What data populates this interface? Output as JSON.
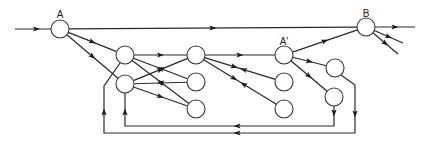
{
  "diagram": {
    "type": "directed-network",
    "colors": {
      "line": "#2a2a2a",
      "node_fill": "#ffffff",
      "node_stroke": "#3a3a3a"
    },
    "nodes": [
      {
        "id": "A",
        "label": "A"
      },
      {
        "id": "L1",
        "label": ""
      },
      {
        "id": "L2",
        "label": ""
      },
      {
        "id": "M1",
        "label": ""
      },
      {
        "id": "M2",
        "label": ""
      },
      {
        "id": "M3",
        "label": ""
      },
      {
        "id": "A'",
        "label": "A'"
      },
      {
        "id": "R2",
        "label": ""
      },
      {
        "id": "R3",
        "label": ""
      },
      {
        "id": "F1",
        "label": ""
      },
      {
        "id": "F2",
        "label": ""
      },
      {
        "id": "B",
        "label": "B"
      }
    ],
    "edges": [
      {
        "from": "input",
        "to": "A",
        "direction": "forward"
      },
      {
        "from": "A",
        "to": "B",
        "direction": "forward"
      },
      {
        "from": "A",
        "to": "L1",
        "direction": "forward"
      },
      {
        "from": "A",
        "to": "L2",
        "direction": "forward"
      },
      {
        "from": "L1",
        "to": "M1",
        "direction": "forward"
      },
      {
        "from": "L2",
        "to": "M1",
        "direction": "forward"
      },
      {
        "from": "M2",
        "to": "L1",
        "direction": "forward"
      },
      {
        "from": "M3",
        "to": "L1",
        "direction": "forward"
      },
      {
        "from": "M2",
        "to": "L2",
        "direction": "forward"
      },
      {
        "from": "L2",
        "to": "M3",
        "direction": "forward"
      },
      {
        "from": "M1",
        "to": "A'",
        "direction": "forward"
      },
      {
        "from": "M1",
        "to": "R2",
        "direction": "bidirectional"
      },
      {
        "from": "M1",
        "to": "R3",
        "direction": "bidirectional"
      },
      {
        "from": "A'",
        "to": "B",
        "direction": "forward"
      },
      {
        "from": "A'",
        "to": "F1",
        "direction": "forward"
      },
      {
        "from": "A'",
        "to": "F2",
        "direction": "forward"
      },
      {
        "from": "B",
        "to": "output-1",
        "direction": "forward"
      },
      {
        "from": "B",
        "to": "output-2",
        "direction": "forward"
      },
      {
        "from": "B",
        "to": "output-3",
        "direction": "forward"
      },
      {
        "from": "F2",
        "to": "L2",
        "direction": "forward",
        "route": "feedback-inner"
      },
      {
        "from": "F1",
        "to": "L1",
        "direction": "forward",
        "route": "feedback-outer"
      }
    ]
  }
}
